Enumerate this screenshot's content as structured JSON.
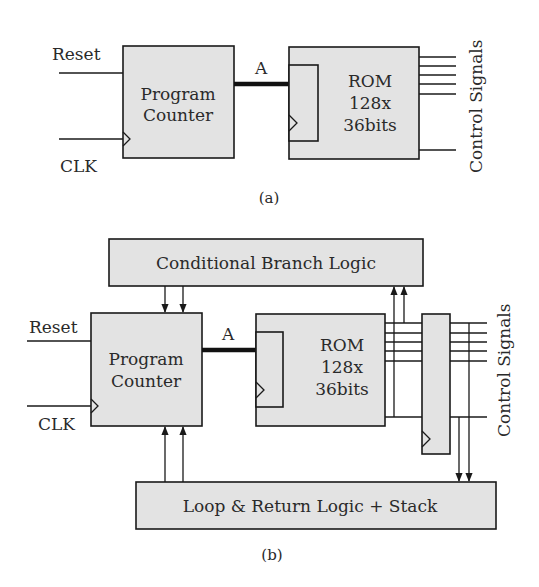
{
  "figure_a": {
    "caption": "(a)",
    "inputs": {
      "reset": "Reset",
      "clk": "CLK"
    },
    "program_counter": {
      "line1": "Program",
      "line2": "Counter"
    },
    "bus_label": "A",
    "rom": {
      "line1": "ROM",
      "line2": "128x",
      "line3": "36bits"
    },
    "outputs_label": "Control Signals"
  },
  "figure_b": {
    "caption": "(b)",
    "inputs": {
      "reset": "Reset",
      "clk": "CLK"
    },
    "branch_logic": "Conditional Branch Logic",
    "program_counter": {
      "line1": "Program",
      "line2": "Counter"
    },
    "bus_label": "A",
    "rom": {
      "line1": "ROM",
      "line2": "128x",
      "line3": "36bits"
    },
    "loop_logic": "Loop & Return Logic + Stack",
    "outputs_label": "Control Signals"
  },
  "colors": {
    "block_fill": "#e3e3e3",
    "stroke": "#1a1a1a",
    "text": "#2a2a2a"
  }
}
